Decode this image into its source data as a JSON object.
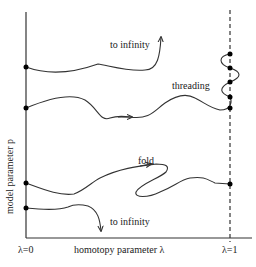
{
  "diagram": {
    "y_axis_label": "model parameter p",
    "x_axis_label": "homotopy parameter λ",
    "x_start_label": "λ=0",
    "x_end_label": "λ=1",
    "annotations": {
      "top_infinity": "to infinity",
      "threading": "threading",
      "fold": "fold",
      "bottom_infinity": "to infinity"
    },
    "colors": {
      "line": "#333333",
      "dot": "#000000",
      "text": "#222222"
    }
  }
}
